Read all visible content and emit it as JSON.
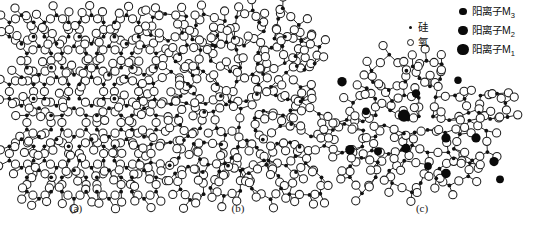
{
  "figure": {
    "caption_a": "(a)",
    "caption_b": "(b)",
    "caption_c": "(c)",
    "bond_color": "#2b2b2b",
    "oxygen_fill": "#ffffff",
    "oxygen_stroke": "#1f1f1f",
    "silicon_fill": "#111111",
    "cation_fill": "#0a0a0a",
    "background": "#ffffff"
  },
  "legend": {
    "atoms": [
      {
        "name": "silicon",
        "label": "硅",
        "marker": "small-filled-dot"
      },
      {
        "name": "oxygen",
        "label": "氧",
        "marker": "open-circle"
      }
    ],
    "cations": [
      {
        "name": "cation-m3",
        "label_prefix": "阳离子M",
        "subscript": "3",
        "marker": "filled-circle",
        "radius": 3.6
      },
      {
        "name": "cation-m2",
        "label_prefix": "阳离子M",
        "subscript": "2",
        "marker": "filled-circle",
        "radius": 4.6
      },
      {
        "name": "cation-m1",
        "label_prefix": "阳离子M",
        "subscript": "1",
        "marker": "filled-circle",
        "radius": 5.8
      }
    ]
  },
  "panels": {
    "a": {
      "name": "crystalline-silica",
      "x": 4,
      "y": 14,
      "w": 146,
      "h": 190,
      "lattice": "regular",
      "cols": 4,
      "rows": 6,
      "cell_w": 35,
      "cell_h": 31,
      "jitter": 0.0,
      "ring_size": 6,
      "oxygen_r": 4.1,
      "silicon_r": 1.9,
      "label_x": 76,
      "label_y": 209
    },
    "b": {
      "name": "amorphous-silica-glass",
      "x": 150,
      "y": 12,
      "w": 164,
      "h": 192,
      "lattice": "irregular",
      "cols": 4,
      "rows": 6,
      "cell_w": 39,
      "cell_h": 31,
      "jitter": 5.4,
      "ring_size": 6,
      "oxygen_r": 4.1,
      "silicon_r": 1.9,
      "label_x": 238,
      "label_y": 209
    },
    "c": {
      "name": "modified-glass-with-cations",
      "x": 322,
      "y": 58,
      "w": 200,
      "h": 148,
      "lattice": "irregular-blob",
      "cols": 4,
      "rows": 4,
      "cell_w": 43,
      "cell_h": 33,
      "jitter": 5.0,
      "ring_size": 6,
      "oxygen_r": 4.1,
      "silicon_r": 1.9,
      "label_x": 422,
      "label_y": 209,
      "cations": [
        {
          "type": "m2",
          "cx": 0.1,
          "cy": 0.16,
          "r": 4.7
        },
        {
          "type": "m3",
          "cx": 0.47,
          "cy": 0.24,
          "r": 4.2
        },
        {
          "type": "m3",
          "cx": 0.68,
          "cy": 0.15,
          "r": 3.7
        },
        {
          "type": "m1",
          "cx": 0.41,
          "cy": 0.39,
          "r": 6.1
        },
        {
          "type": "m3",
          "cx": 0.22,
          "cy": 0.36,
          "r": 3.8
        },
        {
          "type": "m2",
          "cx": 0.62,
          "cy": 0.54,
          "r": 4.6
        },
        {
          "type": "m2",
          "cx": 0.77,
          "cy": 0.54,
          "r": 4.6
        },
        {
          "type": "m2",
          "cx": 0.14,
          "cy": 0.62,
          "r": 4.8
        },
        {
          "type": "m3",
          "cx": 0.28,
          "cy": 0.63,
          "r": 4.0
        },
        {
          "type": "m2",
          "cx": 0.42,
          "cy": 0.61,
          "r": 4.6
        },
        {
          "type": "m3",
          "cx": 0.53,
          "cy": 0.73,
          "r": 3.9
        },
        {
          "type": "m2",
          "cx": 0.62,
          "cy": 0.78,
          "r": 4.7
        },
        {
          "type": "m2",
          "cx": 0.86,
          "cy": 0.7,
          "r": 4.6
        },
        {
          "type": "m3",
          "cx": 0.89,
          "cy": 0.82,
          "r": 3.9
        }
      ]
    }
  }
}
